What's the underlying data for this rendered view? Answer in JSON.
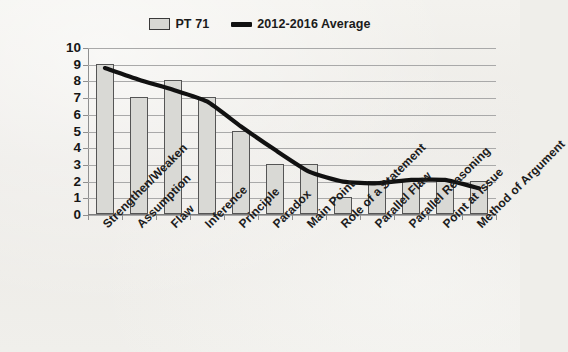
{
  "chart_data": {
    "type": "bar",
    "title": "",
    "subtitle": "",
    "xlabel": "",
    "ylabel": "",
    "ylim": [
      0,
      10
    ],
    "yticks": [
      0,
      1,
      2,
      3,
      4,
      5,
      6,
      7,
      8,
      9,
      10
    ],
    "grid": true,
    "legend_position": "top-center",
    "categories": [
      "Strengthen/Weaken",
      "Assumption",
      "Flaw",
      "Inference",
      "Principle",
      "Paradox",
      "Main Point",
      "Role of a Statement",
      "Parallel Flaw",
      "Parallel Reasoning",
      "Point at Issue",
      "Method of Argument"
    ],
    "series": [
      {
        "name": "PT 71",
        "type": "bar",
        "color": "#d9d9d5",
        "border_color": "#555555",
        "values": [
          9,
          7,
          8,
          7,
          5,
          3,
          3,
          1,
          2,
          2,
          2,
          2
        ]
      },
      {
        "name": "2012-2016 Average",
        "type": "line",
        "color": "#111111",
        "values": [
          8.8,
          8.1,
          7.5,
          6.8,
          5.3,
          3.9,
          2.6,
          2.0,
          1.9,
          2.1,
          2.1,
          1.6
        ]
      }
    ]
  },
  "legend": {
    "items": [
      {
        "label": "PT 71",
        "marker": "bar-swatch",
        "color": "#d9d9d5"
      },
      {
        "label": "2012-2016 Average",
        "marker": "line-swatch",
        "color": "#111111"
      }
    ]
  },
  "colors": {
    "background": "#efeeea",
    "gridline": "#a9a9a9",
    "axis": "#8f8f8f",
    "bar_fill": "#d9d9d5",
    "bar_border": "#555555",
    "line": "#111111",
    "text": "#1b1b1b"
  }
}
